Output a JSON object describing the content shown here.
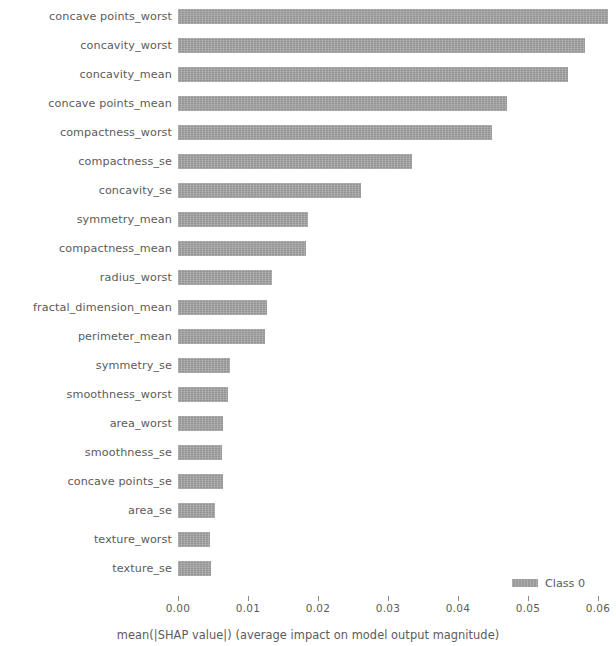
{
  "chart_data": {
    "type": "bar",
    "orientation": "horizontal",
    "title": "",
    "xlabel": "mean(|SHAP value|) (average impact on model output magnitude)",
    "ylabel": "",
    "xlim": [
      0.0,
      0.0626
    ],
    "xticks": [
      0.0,
      0.01,
      0.02,
      0.03,
      0.04,
      0.05,
      0.06
    ],
    "xticklabels": [
      "0.00",
      "0.01",
      "0.02",
      "0.03",
      "0.04",
      "0.05",
      "0.06"
    ],
    "grid": false,
    "legend": {
      "position": "lower right",
      "entries": [
        {
          "name": "Class 0",
          "color": "#a3a3a3"
        }
      ]
    },
    "series": [
      {
        "name": "Class 0",
        "color": "#a3a3a3",
        "categories": [
          "concave points_worst",
          "concavity_worst",
          "concavity_mean",
          "concave points_mean",
          "compactness_worst",
          "compactness_se",
          "concavity_se",
          "symmetry_mean",
          "compactness_mean",
          "radius_worst",
          "fractal_dimension_mean",
          "perimeter_mean",
          "symmetry_se",
          "smoothness_worst",
          "area_worst",
          "smoothness_se",
          "concave points_se",
          "area_se",
          "texture_worst",
          "texture_se"
        ],
        "values": [
          0.0614,
          0.0581,
          0.0557,
          0.047,
          0.0449,
          0.0334,
          0.0261,
          0.0186,
          0.0183,
          0.0134,
          0.0127,
          0.0124,
          0.0074,
          0.0071,
          0.0064,
          0.0063,
          0.0064,
          0.0053,
          0.0046,
          0.0047
        ]
      }
    ]
  },
  "axis": {
    "caption": "mean(|SHAP value|) (average impact on model output magnitude)"
  }
}
